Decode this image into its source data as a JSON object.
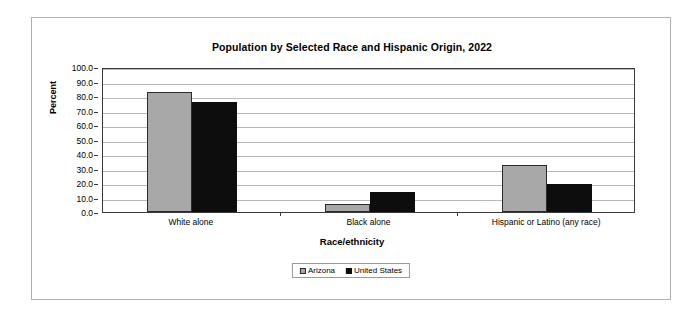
{
  "chart_data": {
    "type": "bar",
    "title": "Population by Selected Race and Hispanic Origin, 2022",
    "xlabel": "Race/ethnicity",
    "ylabel": "Percent",
    "categories": [
      "White alone",
      "Black alone",
      "Hispanic or Latino (any race)"
    ],
    "series": [
      {
        "name": "Arizona",
        "color": "#a8a8a8",
        "values": [
          82.6,
          5.6,
          32.3
        ]
      },
      {
        "name": "United States",
        "color": "#0d0d0d",
        "values": [
          75.8,
          13.6,
          19.1
        ]
      }
    ],
    "ylim": [
      0,
      100
    ],
    "ytick_step": 10,
    "ytick_labels": [
      "0.0",
      "10.0",
      "20.0",
      "30.0",
      "40.0",
      "50.0",
      "60.0",
      "70.0",
      "80.0",
      "90.0",
      "100.0"
    ],
    "grid": true,
    "legend_position": "bottom"
  }
}
